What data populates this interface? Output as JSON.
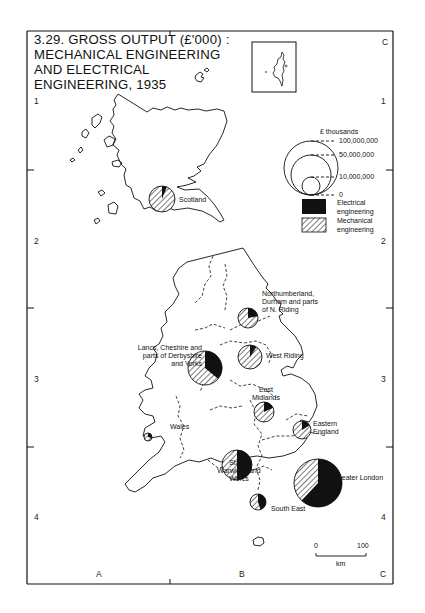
{
  "title": {
    "lines": [
      "3.29. GROSS OUTPUT (£'000) :",
      "MECHANICAL ENGINEERING",
      "AND ELECTRICAL",
      "ENGINEERING, 1935"
    ]
  },
  "grid": {
    "columns": [
      "A",
      "B",
      "C"
    ],
    "rows": [
      "1",
      "2",
      "3",
      "4"
    ],
    "top_right_col": "C"
  },
  "legend": {
    "unit_label": "£  thousands",
    "circle_sizes": [
      "100,000,000",
      "50,000,000",
      "10,000,000",
      "0"
    ],
    "categories": [
      {
        "label_line1": "Electrical",
        "label_line2": "engineering",
        "fill": "solid-black"
      },
      {
        "label_line1": "Mechanical",
        "label_line2": "engineering",
        "fill": "hatched"
      }
    ]
  },
  "scale_bar": {
    "start": "0",
    "end": "100",
    "unit": "km"
  },
  "regions": [
    {
      "name": "Scotland",
      "label_lines": [
        "Scotland"
      ]
    },
    {
      "name": "Northumberland, Durham and parts of N. Riding",
      "label_lines": [
        "Northumberland,",
        "Durham and parts",
        "of N. Riding"
      ]
    },
    {
      "name": "Lancs, Cheshire and parts of Derbyshire and Yorks",
      "label_lines": [
        "Lancs, Cheshire and",
        "parts of Derbyshire",
        "and Yorks"
      ]
    },
    {
      "name": "West Riding",
      "label_lines": [
        "West Riding"
      ]
    },
    {
      "name": "East Midlands",
      "label_lines": [
        "East",
        "Midlands"
      ]
    },
    {
      "name": "Wales",
      "label_lines": [
        "Wales"
      ]
    },
    {
      "name": "Eastern England",
      "label_lines": [
        "Eastern",
        "England"
      ]
    },
    {
      "name": "Staffs, Warwicks and Worcs",
      "label_lines": [
        "Staffs,",
        "Warwicks and",
        "Worcs"
      ]
    },
    {
      "name": "Greater London",
      "label_lines": [
        "Greater London"
      ]
    },
    {
      "name": "South East",
      "label_lines": [
        "South East"
      ]
    }
  ],
  "chart_data": {
    "type": "proportional-pie-map",
    "legend": [
      "Electrical engineering",
      "Mechanical engineering"
    ],
    "size_scale_labels": [
      "100,000,000",
      "50,000,000",
      "10,000,000",
      "0"
    ],
    "series": [
      {
        "region": "Scotland",
        "radius_px": 13,
        "electrical_share": 0.06
      },
      {
        "region": "Northumberland, Durham and parts of N. Riding",
        "radius_px": 10,
        "electrical_share": 0.22
      },
      {
        "region": "Lancs, Cheshire and parts of Derbyshire and Yorks",
        "radius_px": 17,
        "electrical_share": 0.36
      },
      {
        "region": "West Riding",
        "radius_px": 12,
        "electrical_share": 0.09
      },
      {
        "region": "East Midlands",
        "radius_px": 10,
        "electrical_share": 0.18
      },
      {
        "region": "Wales",
        "radius_px": 4,
        "electrical_share": 0.3
      },
      {
        "region": "Eastern England",
        "radius_px": 9,
        "electrical_share": 0.16
      },
      {
        "region": "Staffs, Warwicks and Worcs",
        "radius_px": 15,
        "electrical_share": 0.5
      },
      {
        "region": "Greater London",
        "radius_px": 24,
        "electrical_share": 0.62
      },
      {
        "region": "South East",
        "radius_px": 8,
        "electrical_share": 0.45
      }
    ]
  }
}
